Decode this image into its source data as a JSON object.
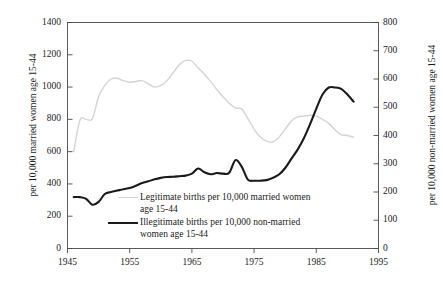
{
  "chart_data": {
    "type": "line",
    "title": "",
    "subtitle": "",
    "xlabel": "",
    "ylabel": "per 10,000 married women age 15-44",
    "y2label": "per 10,000 non-married women age 15-44",
    "grid": false,
    "legend_position": "inside-center-bottom",
    "xlim": [
      1945,
      1995
    ],
    "xticks": [
      1945,
      1955,
      1965,
      1975,
      1985,
      1995
    ],
    "xtick_labels": [
      "1945",
      "1955",
      "1965",
      "1975",
      "1985",
      "1995"
    ],
    "ylim": [
      0,
      1400
    ],
    "yticks": [
      0,
      200,
      400,
      600,
      800,
      1000,
      1200,
      1400
    ],
    "ytick_labels": [
      "0",
      "200",
      "400",
      "600",
      "800",
      "1000",
      "1200",
      "1400"
    ],
    "y2lim": [
      0,
      800
    ],
    "y2ticks": [
      0,
      100,
      200,
      300,
      400,
      500,
      600,
      700,
      800
    ],
    "y2tick_labels": [
      "0",
      "100",
      "200",
      "300",
      "400",
      "500",
      "600",
      "700",
      "800"
    ],
    "series": [
      {
        "name": "Legitimate births per 10,000 married women age 15-44",
        "axis": "left",
        "color": "#d4d4d4",
        "width": 1.4,
        "x": [
          1946,
          1947,
          1948,
          1949,
          1950,
          1951,
          1952,
          1953,
          1954,
          1955,
          1956,
          1957,
          1958,
          1959,
          1960,
          1961,
          1962,
          1963,
          1964,
          1965,
          1966,
          1967,
          1968,
          1969,
          1970,
          1971,
          1972,
          1973,
          1974,
          1975,
          1976,
          1977,
          1978,
          1979,
          1980,
          1981,
          1982,
          1983,
          1984,
          1985,
          1986,
          1987,
          1988,
          1989,
          1990,
          1991
        ],
        "values": [
          600,
          795,
          800,
          805,
          940,
          1010,
          1050,
          1055,
          1040,
          1030,
          1035,
          1040,
          1020,
          1000,
          1010,
          1040,
          1090,
          1140,
          1165,
          1160,
          1120,
          1080,
          1035,
          985,
          940,
          900,
          870,
          865,
          805,
          740,
          690,
          665,
          660,
          690,
          740,
          790,
          815,
          820,
          825,
          820,
          800,
          775,
          735,
          705,
          700,
          690
        ]
      },
      {
        "name": "Illegitimate births per 10,000 non-married women age 15-44",
        "axis": "right",
        "color": "#1a1a1a",
        "width": 2.1,
        "x": [
          1946,
          1947,
          1948,
          1949,
          1950,
          1951,
          1952,
          1953,
          1954,
          1955,
          1956,
          1957,
          1958,
          1959,
          1960,
          1961,
          1962,
          1963,
          1964,
          1965,
          1966,
          1967,
          1968,
          1969,
          1970,
          1971,
          1972,
          1973,
          1974,
          1975,
          1976,
          1977,
          1978,
          1979,
          1980,
          1981,
          1982,
          1983,
          1984,
          1985,
          1986,
          1987,
          1988,
          1989,
          1990,
          1991
        ],
        "values": [
          182,
          182,
          176,
          155,
          165,
          193,
          200,
          205,
          210,
          214,
          222,
          232,
          238,
          245,
          250,
          253,
          254,
          256,
          258,
          265,
          283,
          270,
          263,
          267,
          265,
          268,
          313,
          290,
          244,
          240,
          240,
          242,
          250,
          262,
          285,
          318,
          350,
          390,
          440,
          495,
          545,
          570,
          570,
          565,
          545,
          520
        ]
      }
    ],
    "series_right_equivalent_note": ""
  },
  "axes": {
    "left": {
      "title": "per 10,000 married women age 15-44",
      "ticks": [
        "1400",
        "1200",
        "1000",
        "800",
        "600",
        "400",
        "200",
        "0"
      ]
    },
    "right": {
      "title": "per 10,000 non-married women age 15-44",
      "ticks": [
        "800",
        "700",
        "600",
        "500",
        "400",
        "300",
        "200",
        "100",
        "0"
      ]
    },
    "bottom": {
      "ticks": [
        "1945",
        "1955",
        "1965",
        "1975",
        "1985",
        "1995"
      ]
    }
  },
  "legend": {
    "entries": [
      {
        "line_color": "#d4d4d4",
        "line_width": 1.4,
        "label_line1": "Legitimate births per 10,000 married women",
        "label_line2": "age 15-44"
      },
      {
        "line_color": "#1a1a1a",
        "line_width": 2.1,
        "label_line1": "Illegitimate births per 10,000 non-married",
        "label_line2": "women age 15-44"
      }
    ]
  },
  "colors": {
    "frame": "#4a4a4a",
    "legitimate_line": "#d4d4d4",
    "illegitimate_line": "#1a1a1a",
    "text": "#1a1a1a",
    "background": "#ffffff"
  }
}
